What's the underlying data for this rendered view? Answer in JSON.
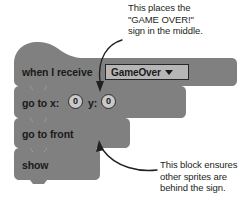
{
  "annotations": {
    "top": "This places the\n\"GAME OVER!\"\nsign in the middle.",
    "bottom": "This block ensures\nother sprites are\nbehind the sign."
  },
  "script": {
    "blocks": [
      {
        "id": "when-i-receive",
        "label": "when I receive",
        "dropdown_value": "GameOver",
        "dropdown_caret": "chevron-down-icon"
      },
      {
        "id": "go-to-xy",
        "label_x": "go to x:",
        "label_y": "y:",
        "value_x": "0",
        "value_y": "0"
      },
      {
        "id": "go-to-front",
        "label": "go to front"
      },
      {
        "id": "show",
        "label": "show"
      }
    ]
  },
  "colors": {
    "block_fill": "#808080",
    "block_text": "#1a1a1a",
    "dropdown_fill": "#b6b6b6",
    "dropdown_border": "#262626",
    "input_fill": "#c9c9c9",
    "annotation_text": "#231f20",
    "arrow": "#231f20",
    "background": "#ffffff"
  }
}
